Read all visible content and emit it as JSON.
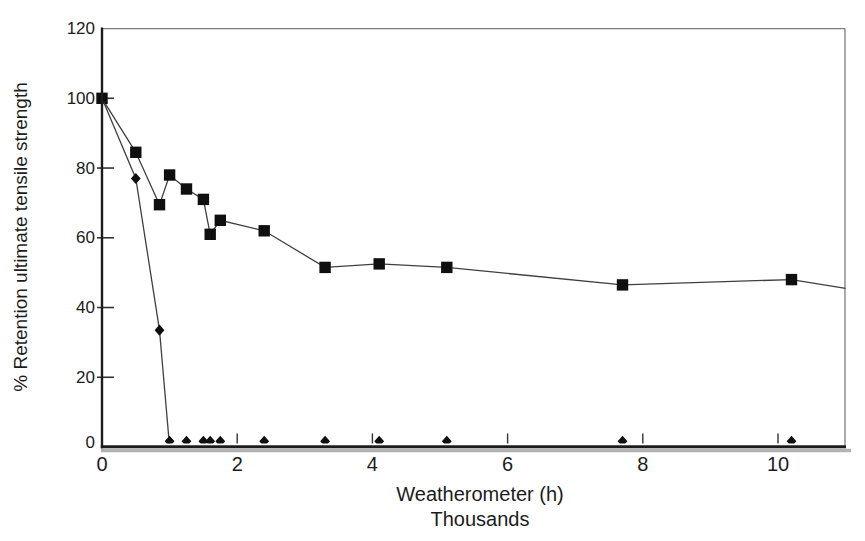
{
  "figure": {
    "background": "#ffffff",
    "ink": "#1c1c1c",
    "series_line_color": "#3f3f3f",
    "marker_color": "#0f0f0f",
    "frame_color": "#7d7d7d",
    "axis_color": "#1c1c1c",
    "scan_shadow_color": "#b2b2b2"
  },
  "chart_data": {
    "type": "line",
    "title": "",
    "xlabel": "Weatherometer (h)",
    "xlabel_sub": "Thousands",
    "ylabel": "% Retention ultimate tensile strength",
    "xlim": [
      0,
      11
    ],
    "ylim": [
      0,
      120
    ],
    "x_ticks": [
      0,
      2,
      4,
      6,
      8,
      10
    ],
    "y_ticks": [
      0,
      20,
      40,
      60,
      80,
      100,
      120
    ],
    "grid": false,
    "legend": "none",
    "x": [
      0,
      0.5,
      0.85,
      1.0,
      1.25,
      1.5,
      1.6,
      1.75,
      2.4,
      3.3,
      4.1,
      5.1,
      7.7,
      10.2
    ],
    "series": [
      {
        "name": "squares",
        "marker": "square",
        "values": [
          100,
          84.5,
          69.5,
          78,
          74,
          71,
          61,
          65,
          62,
          51.5,
          52.5,
          51.5,
          46.5,
          48
        ],
        "line_extends_to": {
          "x": 11.0,
          "y": 45.5
        }
      },
      {
        "name": "diamonds",
        "marker": "diamond",
        "values": [
          100,
          77,
          33.5,
          0,
          0,
          0,
          0,
          0,
          0,
          0,
          0,
          0,
          0,
          0
        ]
      }
    ]
  }
}
